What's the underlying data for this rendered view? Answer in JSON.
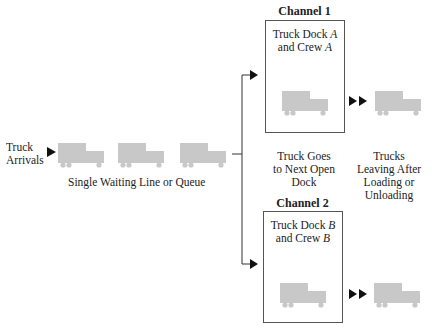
{
  "labels": {
    "truck_arrivals_line1": "Truck",
    "truck_arrivals_line2": "Arrivals",
    "queue": "Single Waiting Line or Queue",
    "goes_line1": "Truck Goes",
    "goes_line2": "to Next Open",
    "goes_line3": "Dock",
    "leaving_line1": "Trucks",
    "leaving_line2": "Leaving After",
    "leaving_line3": "Loading or",
    "leaving_line4": "Unloading"
  },
  "channels": [
    {
      "title": "Channel 1",
      "dock_prefix": "Truck Dock ",
      "dock_letter": "A",
      "crew_prefix": "and Crew ",
      "crew_letter": "A"
    },
    {
      "title": "Channel 2",
      "dock_prefix": "Truck Dock ",
      "dock_letter": "B",
      "crew_prefix": "and Crew ",
      "crew_letter": "B"
    }
  ],
  "colors": {
    "truck": "#c8c8c8",
    "line": "#333333"
  }
}
